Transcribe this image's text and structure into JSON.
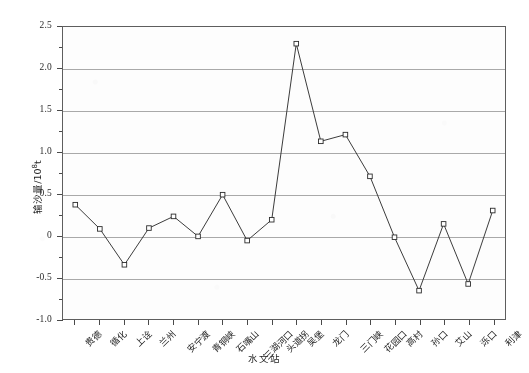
{
  "chart_data": {
    "type": "line",
    "title": "",
    "xlabel": "水文站",
    "ylabel": "输沙量/10⁸t",
    "ylabel_base": "输沙量/10",
    "ylabel_exp": "8",
    "ylabel_unit": "t",
    "grid": true,
    "legend": "none",
    "ylim": [
      -1.0,
      2.5
    ],
    "ytick_labels": [
      "2.5",
      "2.0",
      "1.5",
      "1.0",
      "0.5",
      "0",
      "-0.5",
      "-1.0"
    ],
    "ytick_values": [
      2.5,
      2.0,
      1.5,
      1.0,
      0.5,
      0,
      -0.5,
      -1.0
    ],
    "yminor_step": 0.25,
    "marker": "open-square",
    "line_color": "#3a3a3a",
    "marker_color": "#2b2b2b",
    "grid_color": "#9a9a9a",
    "categories": [
      "贵德",
      "循化",
      "上诠",
      "兰州",
      "安宁渡",
      "青铜峡",
      "石嘴山",
      "三湖河口",
      "头道拐",
      "吴堡",
      "龙门",
      "三门峡",
      "花园口",
      "高村",
      "孙口",
      "艾山",
      "泺口",
      "利津"
    ],
    "values": [
      0.37,
      0.08,
      -0.35,
      0.09,
      0.23,
      -0.01,
      0.49,
      -0.06,
      0.19,
      2.3,
      1.13,
      1.21,
      0.71,
      -0.02,
      -0.66,
      0.14,
      -0.58,
      0.3
    ]
  }
}
